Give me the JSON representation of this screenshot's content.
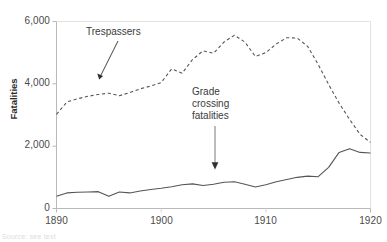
{
  "chart_data": {
    "type": "line",
    "title": "",
    "xlabel": "",
    "ylabel": "Fatalities",
    "xlim": [
      1890,
      1920
    ],
    "ylim": [
      0,
      6000
    ],
    "grid": false,
    "legend_position": "none",
    "x_ticks": [
      "1890",
      "1900",
      "1910",
      "1920"
    ],
    "x_tick_values": [
      1890,
      1900,
      1910,
      1920
    ],
    "y_ticks": [
      "0",
      "2,000",
      "4,000",
      "6,000"
    ],
    "y_tick_values": [
      0,
      2000,
      4000,
      6000
    ],
    "x": [
      1890,
      1891,
      1892,
      1893,
      1894,
      1895,
      1896,
      1897,
      1898,
      1899,
      1900,
      1901,
      1902,
      1903,
      1904,
      1905,
      1906,
      1907,
      1908,
      1909,
      1910,
      1911,
      1912,
      1913,
      1914,
      1915,
      1916,
      1917,
      1918,
      1919,
      1920
    ],
    "series": [
      {
        "name": "Trespassers",
        "style": "dashed",
        "color": "#555555",
        "values": [
          3020,
          3420,
          3520,
          3600,
          3660,
          3700,
          3620,
          3720,
          3840,
          3930,
          4040,
          4480,
          4340,
          4780,
          5060,
          4980,
          5340,
          5560,
          5340,
          4880,
          5000,
          5280,
          5480,
          5470,
          5200,
          4620,
          3980,
          3380,
          2860,
          2380,
          2120
        ]
      },
      {
        "name": "Grade crossing fatalities",
        "style": "solid",
        "color": "#555555",
        "values": [
          390,
          500,
          520,
          530,
          540,
          390,
          530,
          500,
          560,
          610,
          650,
          700,
          760,
          790,
          740,
          780,
          840,
          860,
          780,
          690,
          760,
          860,
          930,
          1000,
          1040,
          1020,
          1320,
          1800,
          1920,
          1800,
          1780
        ]
      }
    ],
    "annotations": [
      {
        "name": "trespassers-label",
        "text": "Trespassers",
        "lines": [
          "Trespassers"
        ],
        "arrow": {
          "from_x": 118,
          "from_y": 42,
          "to_x": 99,
          "to_y": 78,
          "type": "diagonal"
        }
      },
      {
        "name": "grade-crossing-label",
        "text": "Grade crossing fatalities",
        "lines": [
          "Grade",
          "crossing",
          "fatalities"
        ],
        "arrow": {
          "from_x": 215,
          "from_y": 126,
          "to_x": 215,
          "to_y": 168,
          "type": "vertical"
        }
      }
    ]
  },
  "axis": {
    "y_label": "Fatalities",
    "y_tick_labels": [
      "6,000",
      "4,000",
      "2,000",
      "0"
    ],
    "x_tick_labels": [
      "1890",
      "1900",
      "1910",
      "1920"
    ]
  },
  "annotations": {
    "trespassers": "Trespassers",
    "grade_line_1": "Grade",
    "grade_line_2": "crossing",
    "grade_line_3": "fatalities"
  },
  "footer": {
    "note": "Source: see text"
  },
  "colors": {
    "line": "#555555",
    "axis": "#b9b9b9",
    "text": "#3a3a3a",
    "background": "#ffffff"
  }
}
